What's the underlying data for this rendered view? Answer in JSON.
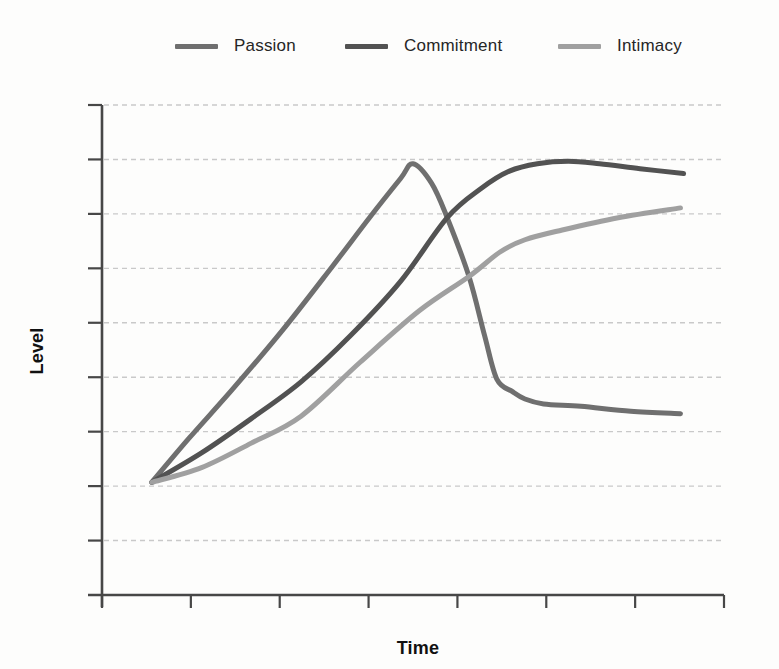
{
  "legend": {
    "items": [
      {
        "label": "Passion",
        "color": "#6f6f6f"
      },
      {
        "label": "Commitment",
        "color": "#525252"
      },
      {
        "label": "Intimacy",
        "color": "#a0a0a0"
      }
    ]
  },
  "axes": {
    "x_label": "Time",
    "y_label": "Level"
  },
  "chart_data": {
    "type": "line",
    "title": "",
    "xlabel": "Time",
    "ylabel": "Level",
    "xlim": [
      0,
      100
    ],
    "ylim": [
      0,
      100
    ],
    "x_tick_count": 8,
    "y_grid_count": 9,
    "grid": "dashed-horizontal",
    "tick_labels": "none (qualitative axes)",
    "legend_position": "top",
    "style": {
      "axis_color": "#474747",
      "grid_color": "#c9c9c9",
      "background": "#fdfdfc",
      "curve_width": 5
    },
    "series": [
      {
        "name": "Passion",
        "color": "#6f6f6f",
        "points": [
          [
            8,
            23
          ],
          [
            14,
            32
          ],
          [
            21,
            42
          ],
          [
            29,
            54
          ],
          [
            37,
            67
          ],
          [
            43,
            77
          ],
          [
            48,
            85
          ],
          [
            50,
            88
          ],
          [
            53,
            84
          ],
          [
            55.5,
            77
          ],
          [
            59,
            65
          ],
          [
            61.5,
            53
          ],
          [
            63.5,
            44
          ],
          [
            66,
            41.5
          ],
          [
            68,
            40
          ],
          [
            71,
            39
          ],
          [
            77,
            38.5
          ],
          [
            85,
            37.5
          ],
          [
            93,
            37
          ]
        ]
      },
      {
        "name": "Commitment",
        "color": "#525252",
        "points": [
          [
            8,
            23
          ],
          [
            16,
            29
          ],
          [
            24,
            36
          ],
          [
            32,
            43.5
          ],
          [
            40,
            53
          ],
          [
            48,
            64
          ],
          [
            55.5,
            77
          ],
          [
            61,
            83
          ],
          [
            65.5,
            86.5
          ],
          [
            70,
            88
          ],
          [
            75,
            88.5
          ],
          [
            80,
            88
          ],
          [
            86.5,
            87
          ],
          [
            93.5,
            86
          ]
        ]
      },
      {
        "name": "Intimacy",
        "color": "#a0a0a0",
        "points": [
          [
            8,
            23
          ],
          [
            16,
            26
          ],
          [
            24,
            31
          ],
          [
            32,
            36.5
          ],
          [
            41.5,
            47.5
          ],
          [
            51,
            58
          ],
          [
            59,
            65
          ],
          [
            64,
            70
          ],
          [
            68,
            72.5
          ],
          [
            74,
            74.5
          ],
          [
            83,
            77
          ],
          [
            93,
            79
          ]
        ]
      }
    ]
  }
}
